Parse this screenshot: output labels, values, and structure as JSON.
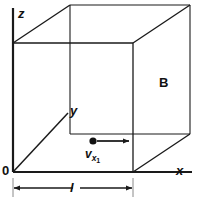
{
  "figure": {
    "background_color": "#ffffff",
    "line_color": "#1a1a1a",
    "axes": {
      "z_label": "z",
      "y_label": "y",
      "x_label": "x",
      "origin_label": "0"
    },
    "body_label": "B",
    "length_label": "l",
    "velocity": {
      "base": "v",
      "subscript_letter": "x",
      "subscript_number": "1"
    },
    "geometry": {
      "front_face": {
        "left": 13,
        "right": 133,
        "top": 43,
        "bottom": 172
      },
      "depth_offset_x": 57,
      "depth_offset_y": -38,
      "axis_z_top": 8,
      "axis_x_right": 192,
      "axis_y_end_x": 68,
      "axis_y_end_y": 113,
      "dot": {
        "x": 93,
        "y": 141,
        "radius": 3.6
      },
      "arrow": {
        "from_x": 97,
        "to_x": 129,
        "y": 141
      },
      "dimension_line": {
        "y": 188,
        "from_x": 13,
        "to_x": 133
      }
    }
  }
}
